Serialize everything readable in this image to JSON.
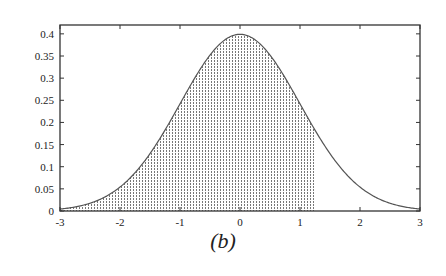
{
  "chart_data": {
    "type": "area",
    "title": "",
    "caption": "(b)",
    "xlabel": "",
    "ylabel": "",
    "xlim": [
      -3,
      3
    ],
    "ylim": [
      0,
      0.42
    ],
    "x_ticks": [
      -3,
      -2,
      -1,
      0,
      1,
      2,
      3
    ],
    "x_tick_labels": [
      "-3",
      "-2",
      "-1",
      "0",
      "1",
      "2",
      "3"
    ],
    "y_ticks": [
      0,
      0.05,
      0.1,
      0.15,
      0.2,
      0.25,
      0.3,
      0.35,
      0.4
    ],
    "y_tick_labels": [
      "0",
      "0.05",
      "0.1",
      "0.15",
      "0.2",
      "0.25",
      "0.3",
      "0.35",
      "0.4"
    ],
    "grid": false,
    "legend": null,
    "series": [
      {
        "name": "standard normal density",
        "function": "exp(-x^2/2)/sqrt(2*pi)",
        "x": [
          -3,
          -2.5,
          -2,
          -1.5,
          -1,
          -0.5,
          0,
          0.5,
          1,
          1.5,
          2,
          2.5,
          3
        ],
        "values": [
          0.0044,
          0.0175,
          0.054,
          0.1295,
          0.242,
          0.3521,
          0.3989,
          0.3521,
          0.242,
          0.1295,
          0.054,
          0.0175,
          0.0044
        ]
      }
    ],
    "shaded_region": {
      "from": -3,
      "to": 1.25,
      "pattern": "vertical dotted hatch"
    }
  },
  "colors": {
    "curve": "#555555",
    "axis": "#333333",
    "hatch": "#666666",
    "background": "#ffffff"
  }
}
